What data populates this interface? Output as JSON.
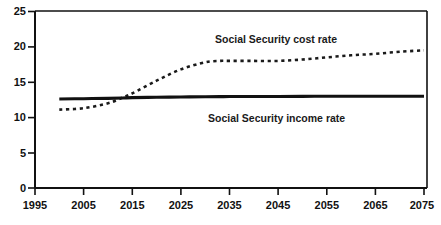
{
  "chart_data": {
    "type": "line",
    "title": "",
    "subtitle": "",
    "xlabel": "",
    "ylabel": "",
    "xlim": [
      1995,
      2075
    ],
    "ylim": [
      0,
      25
    ],
    "xticks": [
      1995,
      2005,
      2015,
      2025,
      2035,
      2045,
      2055,
      2065,
      2075
    ],
    "yticks": [
      0,
      5,
      10,
      15,
      20,
      25
    ],
    "grid": false,
    "legend_position": "inline-annotations",
    "x": [
      2000,
      2005,
      2010,
      2013,
      2015,
      2020,
      2025,
      2030,
      2033,
      2035,
      2040,
      2045,
      2050,
      2055,
      2060,
      2065,
      2070,
      2075
    ],
    "series": [
      {
        "name": "Social Security cost rate",
        "style": "dotted",
        "color": "#1a1a1a",
        "values": [
          11.1,
          11.3,
          12.0,
          12.8,
          13.4,
          15.2,
          16.8,
          17.8,
          18.0,
          18.0,
          18.0,
          18.0,
          18.2,
          18.5,
          18.8,
          19.0,
          19.3,
          19.5
        ]
      },
      {
        "name": "Social Security income rate",
        "style": "solid",
        "color": "#111111",
        "values": [
          12.6,
          12.65,
          12.7,
          12.75,
          12.8,
          12.85,
          12.9,
          12.92,
          12.94,
          12.95,
          12.96,
          12.97,
          12.98,
          12.99,
          13.0,
          13.0,
          13.0,
          13.0
        ]
      }
    ],
    "annotations": [
      {
        "label": "Social Security cost rate",
        "x": 2034,
        "y": 20.6
      },
      {
        "label": "Social Security income rate",
        "x": 2035,
        "y": 11.5
      }
    ]
  },
  "axes": {
    "y_tick_labels": [
      "25",
      "20",
      "15",
      "10",
      "5",
      "0"
    ],
    "x_tick_labels": [
      "1995",
      "2005",
      "2015",
      "2025",
      "2035",
      "2045",
      "2055",
      "2065",
      "2075"
    ]
  },
  "colors": {
    "axis": "#111111",
    "cost_rate": "#1a1a1a",
    "income_rate": "#111111",
    "background": "#ffffff",
    "text": "#111111"
  }
}
